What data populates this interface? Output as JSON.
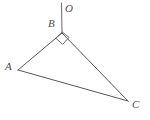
{
  "figure": {
    "background_color": "#ffffff",
    "line_color": "#565656",
    "label_color": "#4d4d4d",
    "canvas": {
      "width": 150,
      "height": 120
    },
    "points": [
      {
        "name": "A",
        "label": "A",
        "x": 18,
        "y": 70,
        "label_x": 5,
        "label_y": 61
      },
      {
        "name": "B",
        "label": "B",
        "x": 62,
        "y": 33,
        "label_x": 48,
        "label_y": 18
      },
      {
        "name": "C",
        "label": "C",
        "x": 128,
        "y": 101,
        "label_x": 132,
        "label_y": 99
      },
      {
        "name": "O",
        "label": "O",
        "x": 61,
        "y": 3,
        "label_x": 65,
        "label_y": 3
      }
    ],
    "segments": [
      {
        "name": "AB",
        "from": "A",
        "to": "B"
      },
      {
        "name": "BC",
        "from": "B",
        "to": "C"
      },
      {
        "name": "AC",
        "from": "A",
        "to": "C"
      },
      {
        "name": "BO",
        "from": "B",
        "to": "O"
      }
    ],
    "angle_marks": [
      {
        "name": "right-angle-at-B",
        "vertex": "B",
        "type": "right-angle-square"
      }
    ]
  }
}
